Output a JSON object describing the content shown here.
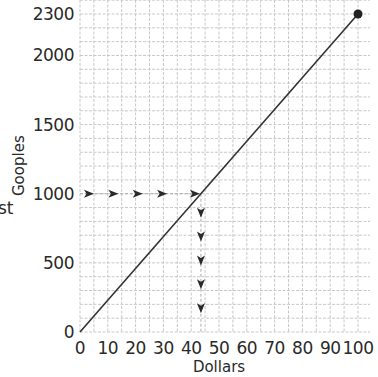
{
  "chart_data": {
    "type": "line",
    "title": "",
    "xlabel": "Dollars",
    "ylabel": "Gooples",
    "cut_label_fragment": "st",
    "xlim": [
      0,
      100
    ],
    "ylim": [
      0,
      2300
    ],
    "x_ticks": [
      0,
      10,
      20,
      30,
      40,
      50,
      60,
      70,
      80,
      90,
      100
    ],
    "y_ticks": [
      0,
      500,
      1000,
      1500,
      2000,
      2300
    ],
    "grid": {
      "on": true,
      "x_minor_step": 5,
      "y_minor_step": 100,
      "color": "#c8c8c8",
      "style": "dashed"
    },
    "series": [
      {
        "name": "Gooples per Dollar",
        "x": [
          0,
          100
        ],
        "y": [
          0,
          2300
        ],
        "color": "#333333",
        "endpoint_marker": {
          "x": 100,
          "y": 2300
        }
      }
    ],
    "annotations": [
      {
        "type": "dashed-arrow-path",
        "direction": "right",
        "from": [
          0,
          1000
        ],
        "to": [
          43.5,
          1000
        ],
        "arrow_count": 5
      },
      {
        "type": "dashed-arrow-path",
        "direction": "down",
        "from": [
          43.5,
          1000
        ],
        "to": [
          43.5,
          0
        ],
        "arrow_count": 5
      }
    ]
  }
}
